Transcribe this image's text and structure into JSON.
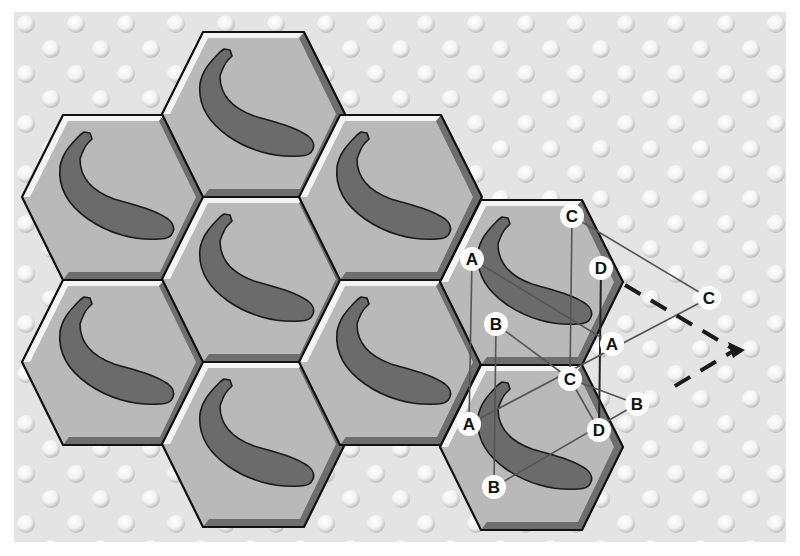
{
  "figure": {
    "background": {
      "panel_color": "#e6e6e6",
      "dot_color": "#fafafa",
      "border_color": "#ffffff"
    },
    "colors": {
      "tile_fill": "#b9b9b9",
      "tile_outline": "#111111",
      "tile_highlight": "#f4f4f4",
      "tile_shadow": "#6e6e6e",
      "banana_fill": "#6b6b6b",
      "banana_outline": "#1a1a1a",
      "construction_line": "#555555",
      "dashed_arrow": "#1a1a1a",
      "label_bg": "#ffffff",
      "label_text": "#111111"
    },
    "tiles": [
      {
        "id": "t1",
        "col": 0,
        "row": 0,
        "icon": "banana"
      },
      {
        "id": "t2",
        "col": 0,
        "row": 1,
        "icon": "banana"
      },
      {
        "id": "t3",
        "col": 1,
        "row": 0,
        "icon": "banana"
      },
      {
        "id": "t4",
        "col": 1,
        "row": 1,
        "icon": "banana"
      },
      {
        "id": "t5",
        "col": 1,
        "row": 2,
        "icon": "banana"
      },
      {
        "id": "t6",
        "col": 2,
        "row": 0,
        "icon": "banana"
      },
      {
        "id": "t7",
        "col": 2,
        "row": 1,
        "icon": "banana"
      },
      {
        "id": "t8",
        "col": 3,
        "row": 0,
        "icon": "banana",
        "annotated": true
      },
      {
        "id": "t9",
        "col": 3,
        "row": 1,
        "icon": "banana",
        "annotated": true
      }
    ],
    "point_labels": [
      {
        "text": "C",
        "x": 572,
        "y": 216
      },
      {
        "text": "A",
        "x": 472,
        "y": 259
      },
      {
        "text": "D",
        "x": 601,
        "y": 268
      },
      {
        "text": "C",
        "x": 709,
        "y": 298
      },
      {
        "text": "B",
        "x": 496,
        "y": 324
      },
      {
        "text": "A",
        "x": 612,
        "y": 344
      },
      {
        "text": "C",
        "x": 570,
        "y": 379
      },
      {
        "text": "B",
        "x": 637,
        "y": 404
      },
      {
        "text": "A",
        "x": 469,
        "y": 424
      },
      {
        "text": "D",
        "x": 599,
        "y": 430
      },
      {
        "text": "B",
        "x": 494,
        "y": 487
      }
    ]
  }
}
